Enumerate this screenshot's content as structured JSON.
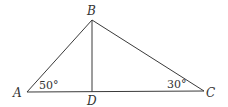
{
  "diagram": {
    "type": "triangle-with-altitude",
    "points": {
      "A": {
        "label": "A",
        "x": 27,
        "y": 92
      },
      "B": {
        "label": "B",
        "x": 92,
        "y": 20
      },
      "C": {
        "label": "C",
        "x": 204,
        "y": 91
      },
      "D": {
        "label": "D",
        "x": 92,
        "y": 92
      }
    },
    "segments": [
      "AB",
      "BC",
      "AC",
      "BD"
    ],
    "angles": {
      "A": "50°",
      "C": "30°"
    },
    "line_color": "#3a3a3a"
  }
}
